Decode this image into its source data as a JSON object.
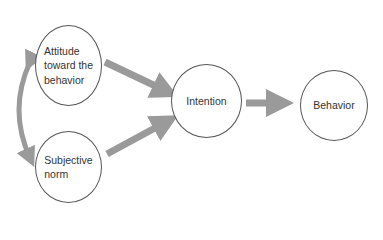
{
  "diagram": {
    "title": "",
    "nodes": {
      "attitude": {
        "line1": "Attitude",
        "line2": "toward the",
        "line3": "behavior"
      },
      "subjective_norm": {
        "line1": "Subjective",
        "line2": "norm"
      },
      "intention": {
        "label": "Intention"
      },
      "behavior": {
        "label": "Behavior"
      }
    },
    "edges": [
      {
        "from": "attitude",
        "to": "subjective_norm",
        "type": "bidirectional-curved"
      },
      {
        "from": "attitude",
        "to": "intention",
        "type": "directed"
      },
      {
        "from": "subjective_norm",
        "to": "intention",
        "type": "directed"
      },
      {
        "from": "intention",
        "to": "behavior",
        "type": "directed"
      }
    ],
    "colors": {
      "arrow": "#9a9a9a",
      "node_border": "#555555",
      "text": "#333333"
    }
  }
}
